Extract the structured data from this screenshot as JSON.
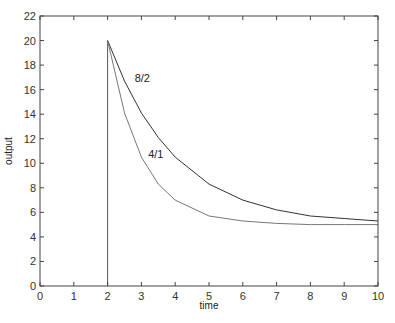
{
  "chart_data": {
    "type": "line",
    "title": "",
    "xlabel": "time",
    "ylabel": "output",
    "xlim": [
      0,
      10
    ],
    "ylim": [
      0,
      22
    ],
    "xticks": [
      0,
      1,
      2,
      3,
      4,
      5,
      6,
      7,
      8,
      9,
      10
    ],
    "yticks": [
      0,
      2,
      4,
      6,
      8,
      10,
      12,
      14,
      16,
      18,
      20,
      22
    ],
    "grid": false,
    "legend": null,
    "annotations": [
      {
        "text": "8/2",
        "x": 2.8,
        "y": 16.6
      },
      {
        "text": "4/1",
        "x": 3.2,
        "y": 10.4
      }
    ],
    "series": [
      {
        "name": "8/2",
        "description": "step to 20 at t=2 then exponential decay toward 5 with time constant 2",
        "x": [
          2,
          2.5,
          3,
          3.5,
          4,
          5,
          6,
          7,
          8,
          9,
          10
        ],
        "y": [
          20,
          16.7,
          14.1,
          12.1,
          10.5,
          8.3,
          7.0,
          6.2,
          5.7,
          5.5,
          5.3
        ],
        "color": "#333333"
      },
      {
        "name": "4/1",
        "description": "step to 20 at t=2 then exponential decay toward 5 with time constant 1",
        "x": [
          2,
          2.5,
          3,
          3.5,
          4,
          5,
          6,
          7,
          8,
          9,
          10
        ],
        "y": [
          20,
          14.1,
          10.5,
          8.3,
          7.0,
          5.7,
          5.3,
          5.1,
          5.0,
          5.0,
          5.0
        ],
        "color": "#777777"
      }
    ]
  }
}
